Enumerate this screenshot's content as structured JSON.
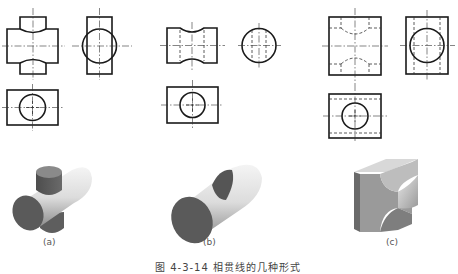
{
  "figure": {
    "caption": "图 4-3-14   相贯线的几种形式",
    "panels": [
      {
        "id": "a",
        "label": "(a)",
        "description": "Two intersecting solid cylinders (vertical cylinder through horizontal cylinder)"
      },
      {
        "id": "b",
        "label": "(b)",
        "description": "Cylinder with a cylindrical through-hole"
      },
      {
        "id": "c",
        "label": "(c)",
        "description": "Block with an internal cylindrical hole intersecting another cylindrical hole"
      }
    ]
  },
  "colors": {
    "line": "#1a1a1a",
    "background": "#ffffff",
    "solid_dark": "#5a5a5a",
    "solid_light": "#e8e8e8"
  }
}
